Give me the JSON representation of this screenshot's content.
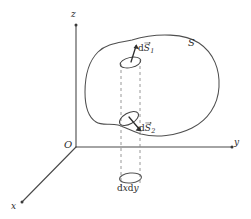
{
  "figure": {
    "name": "surface-integral-diagram",
    "background_color": "#ffffff",
    "line_color": "#4a4a4a",
    "dashed_color": "#8c8c8c",
    "arrow_color": "#2e2e2e"
  },
  "axes": {
    "z_label": "z",
    "y_label": "y",
    "x_label": "x",
    "origin_label": "O"
  },
  "surface": {
    "label": "S"
  },
  "elements": {
    "upper": {
      "prefix": "d",
      "symbol": "S",
      "subscript": "1",
      "full_label": "dS⃗1"
    },
    "lower": {
      "prefix": "d",
      "symbol": "S",
      "subscript": "2",
      "full_label": "dS⃗2"
    }
  },
  "projection": {
    "label_prefix": "d",
    "label_x": "x",
    "label_mid": "d",
    "label_y": "y",
    "full_label": "dxdy"
  }
}
